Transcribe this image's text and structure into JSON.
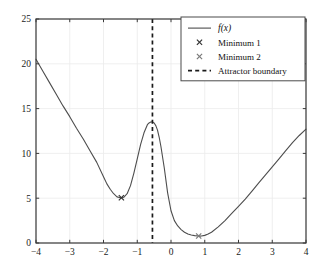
{
  "chart_data": {
    "type": "line",
    "title": "",
    "xlabel": "",
    "ylabel": "",
    "xlim": [
      -4,
      4
    ],
    "ylim": [
      0,
      25
    ],
    "grid": true,
    "xticks": [
      -4,
      -3,
      -2,
      -1,
      0,
      1,
      2,
      3,
      4
    ],
    "xtick_labels": [
      "-4",
      "-3",
      "-2",
      "-1",
      "0",
      "1",
      "2",
      "3",
      "4"
    ],
    "yticks": [
      0,
      5,
      10,
      15,
      20,
      25
    ],
    "ytick_labels": [
      "0",
      "5",
      "10",
      "15",
      "20",
      "25"
    ],
    "legend_position": "top-right",
    "series": [
      {
        "name": "f(x)",
        "type": "line",
        "color": "#4d4d4d",
        "x": [
          -4.0,
          -3.8,
          -3.6,
          -3.4,
          -3.2,
          -3.0,
          -2.8,
          -2.6,
          -2.4,
          -2.2,
          -2.0,
          -1.9,
          -1.8,
          -1.7,
          -1.6,
          -1.5,
          -1.45,
          -1.4,
          -1.3,
          -1.2,
          -1.1,
          -1.0,
          -0.9,
          -0.8,
          -0.7,
          -0.65,
          -0.6,
          -0.55,
          -0.5,
          -0.45,
          -0.4,
          -0.35,
          -0.3,
          -0.2,
          -0.1,
          0.0,
          0.1,
          0.2,
          0.3,
          0.4,
          0.5,
          0.6,
          0.7,
          0.8,
          0.85,
          0.9,
          1.0,
          1.1,
          1.2,
          1.4,
          1.6,
          1.8,
          2.0,
          2.2,
          2.4,
          2.6,
          2.8,
          3.0,
          3.2,
          3.4,
          3.6,
          3.8,
          4.0
        ],
        "y": [
          20.5,
          19.2,
          17.9,
          16.6,
          15.3,
          14.1,
          12.8,
          11.6,
          10.3,
          9.0,
          7.4,
          6.6,
          6.0,
          5.5,
          5.15,
          5.05,
          5.05,
          5.1,
          5.5,
          6.4,
          7.8,
          9.4,
          11.0,
          12.3,
          13.2,
          13.4,
          13.5,
          13.52,
          13.4,
          13.1,
          12.6,
          11.8,
          10.8,
          8.4,
          5.6,
          3.6,
          2.5,
          1.9,
          1.5,
          1.2,
          1.0,
          0.9,
          0.82,
          0.78,
          0.77,
          0.78,
          0.85,
          1.0,
          1.2,
          1.8,
          2.5,
          3.3,
          4.1,
          4.9,
          5.8,
          6.7,
          7.6,
          8.5,
          9.4,
          10.3,
          11.2,
          12.0,
          12.7
        ]
      },
      {
        "name": "Minimum 1",
        "type": "scatter",
        "marker": "x",
        "color": "#333333",
        "x": [
          -1.47
        ],
        "y": [
          5.05
        ]
      },
      {
        "name": "Minimum 2",
        "type": "scatter",
        "marker": "x",
        "color": "#7a7a7a",
        "x": [
          0.82
        ],
        "y": [
          0.78
        ]
      },
      {
        "name": "Attractor boundary",
        "type": "vline",
        "style": "dashed",
        "color": "#1a1a1a",
        "x": [
          -0.55
        ]
      }
    ],
    "annotations": []
  },
  "legend": {
    "entries": [
      {
        "label": "f(x)",
        "glyph": "line-sample",
        "math": true
      },
      {
        "label": "Minimum 1",
        "glyph": "cross-marker",
        "math": false
      },
      {
        "label": "Minimum 2",
        "glyph": "cross-marker",
        "math": false
      },
      {
        "label": "Attractor boundary",
        "glyph": "dashed-line-sample",
        "math": false
      }
    ]
  },
  "style": {
    "axis_color": "#3a3a3a",
    "grid_color": "#ebebeb",
    "curve_color": "#4d4d4d",
    "background": "#ffffff",
    "legend_border": "#4a4a4a"
  }
}
